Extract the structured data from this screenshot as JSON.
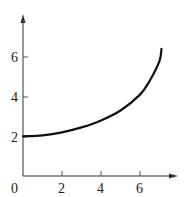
{
  "chart_data": {
    "type": "line",
    "title": "",
    "xlabel": "",
    "ylabel": "",
    "xlim": [
      0,
      7.8
    ],
    "ylim": [
      0,
      7.9
    ],
    "grid": false,
    "legend": null,
    "x_ticks": [
      "0",
      "2",
      "4",
      "6"
    ],
    "y_ticks": [
      "2",
      "4",
      "6"
    ],
    "series": [
      {
        "name": "curve",
        "x": [
          0,
          1,
          2,
          3,
          4,
          5,
          6,
          6.5,
          7,
          7.1
        ],
        "y": [
          2,
          2.05,
          2.2,
          2.45,
          2.8,
          3.3,
          4.1,
          4.8,
          5.8,
          6.4
        ]
      }
    ]
  },
  "axes": {
    "origin_label": "0",
    "x_tick_labels": [
      "2",
      "4",
      "6"
    ],
    "y_tick_labels": [
      "2",
      "4",
      "6"
    ]
  },
  "colors": {
    "curve": "#111111",
    "axis": "#333333"
  }
}
